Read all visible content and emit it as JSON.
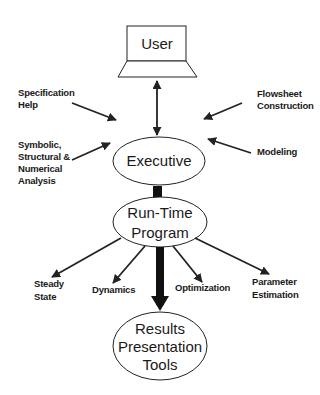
{
  "diagram": {
    "nodes": {
      "user": {
        "label": "User",
        "shape": "laptop"
      },
      "executive": {
        "label": "Executive",
        "shape": "ellipse"
      },
      "runtime": {
        "line1": "Run-Time",
        "line2": "Program",
        "shape": "ellipse"
      },
      "results": {
        "line1": "Results",
        "line2": "Presentation",
        "line3": "Tools",
        "shape": "ellipse"
      }
    },
    "executive_inputs": {
      "spec_help": {
        "line1": "Specification",
        "line2": "Help"
      },
      "analysis": {
        "line1": "Symbolic,",
        "line2": "Structural &",
        "line3": "Numerical",
        "line4": "Analysis"
      },
      "flowsheet": {
        "line1": "Flowsheet",
        "line2": "Construction"
      },
      "modeling": {
        "line1": "Modeling"
      }
    },
    "runtime_outputs": {
      "steady": {
        "line1": "Steady",
        "line2": "State"
      },
      "dynamics": {
        "line1": "Dynamics"
      },
      "optimization": {
        "line1": "Optimization"
      },
      "param": {
        "line1": "Parameter",
        "line2": "Estimation"
      }
    },
    "edges": [
      {
        "from": "user",
        "to": "executive",
        "style": "double-arrow-thin"
      },
      {
        "from": "spec_help",
        "to": "executive",
        "style": "arrow-thin"
      },
      {
        "from": "analysis",
        "to": "executive",
        "style": "arrow-thin"
      },
      {
        "from": "flowsheet",
        "to": "executive",
        "style": "arrow-thin"
      },
      {
        "from": "modeling",
        "to": "executive",
        "style": "arrow-thin"
      },
      {
        "from": "executive",
        "to": "runtime",
        "style": "arrow-thick"
      },
      {
        "from": "runtime",
        "to": "steady",
        "style": "arrow-thin"
      },
      {
        "from": "runtime",
        "to": "dynamics",
        "style": "arrow-thin"
      },
      {
        "from": "runtime",
        "to": "optimization",
        "style": "arrow-thin"
      },
      {
        "from": "runtime",
        "to": "param",
        "style": "arrow-thin"
      },
      {
        "from": "runtime",
        "to": "results",
        "style": "arrow-thick"
      }
    ],
    "colors": {
      "stroke": "#222222",
      "background": "#ffffff",
      "text": "#1a1a1a"
    }
  }
}
